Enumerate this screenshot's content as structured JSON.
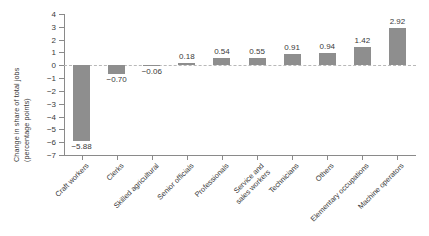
{
  "chart_data": {
    "type": "bar",
    "title": "",
    "xlabel": "",
    "ylabel": "Change in share of total jobs (percentage points)",
    "ylabel_lines": [
      "Change in share of total jobs",
      "(percentage points)"
    ],
    "categories": [
      "Craft workers",
      "Clerks",
      "Skilled agricultural",
      "Senior officials",
      "Professionals",
      "Service and sales workers",
      "Technicians",
      "Others",
      "Elementary occupations",
      "Machine operators"
    ],
    "category_lines": [
      [
        "Craft workers"
      ],
      [
        "Clerks"
      ],
      [
        "Skilled agricultural"
      ],
      [
        "Senior officials"
      ],
      [
        "Professionals"
      ],
      [
        "Service and",
        "sales workers"
      ],
      [
        "Technicians"
      ],
      [
        "Others"
      ],
      [
        "Elementary occupations"
      ],
      [
        "Machine operators"
      ]
    ],
    "values": [
      -5.88,
      -0.7,
      -0.06,
      0.18,
      0.54,
      0.55,
      0.91,
      0.94,
      1.42,
      2.92
    ],
    "value_labels": [
      "−5.88",
      "−0.70",
      "−0.06",
      "0.18",
      "0.54",
      "0.55",
      "0.91",
      "0.94",
      "1.42",
      "2.92"
    ],
    "ylim": [
      -7,
      4
    ],
    "yticks": [
      4,
      3,
      2,
      1,
      0,
      -1,
      -2,
      -3,
      -4,
      -5,
      -6,
      -7
    ],
    "ytick_labels": [
      "4",
      "3",
      "2",
      "1",
      "0",
      "−1",
      "−2",
      "−3",
      "−4",
      "−5",
      "−6",
      "−7"
    ],
    "grid": false,
    "legend": null,
    "zero_line": true,
    "bar_color": "#8e8e8e",
    "axis_color": "#8a8a8a",
    "text_color": "#3a3a3a",
    "zero_line_color": "#b9b9b9",
    "background": "#ffffff"
  }
}
